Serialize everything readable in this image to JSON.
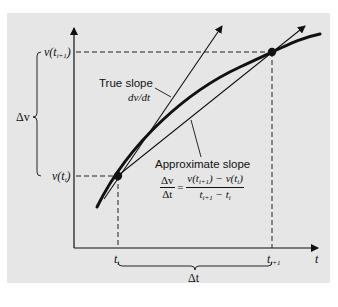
{
  "diagram": {
    "type": "derivative-approximation",
    "axes": {
      "x_label": "t",
      "y_label": ""
    },
    "y_ticks": {
      "upper": {
        "prefix": "v(t",
        "sub": "i+1",
        "suffix": ")"
      },
      "lower": {
        "prefix": "v(t",
        "sub": "i",
        "suffix": ")"
      }
    },
    "x_ticks": {
      "left": {
        "prefix": "t",
        "sub": "i"
      },
      "right": {
        "prefix": "t",
        "sub": "i+1"
      }
    },
    "brace_labels": {
      "vertical": "Δv",
      "horizontal": "Δt"
    },
    "true_slope": {
      "title": "True slope",
      "expr": "dv/dt"
    },
    "approx_slope": {
      "title": "Approximate slope",
      "lhs_num": "Δv",
      "lhs_den": "Δt",
      "equals": "=",
      "rhs_num_a": "v(t",
      "rhs_num_a_sub": "i+1",
      "rhs_num_b": ") − v(t",
      "rhs_num_b_sub": "i",
      "rhs_num_c": ")",
      "rhs_den_a": "t",
      "rhs_den_a_sub": "i+1",
      "rhs_den_b": " − t",
      "rhs_den_b_sub": "i"
    },
    "colors": {
      "panel": "#e6e6e6",
      "ink": "#111111"
    }
  }
}
